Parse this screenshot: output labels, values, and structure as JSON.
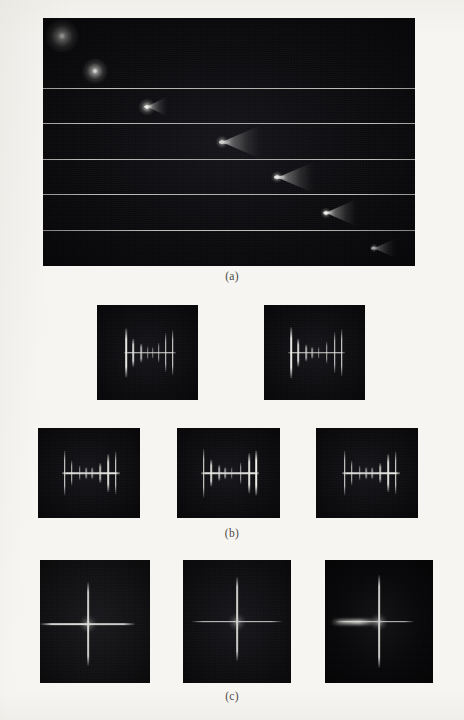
{
  "figure": {
    "background_color": "#f6f5f2",
    "panel_background_color": "#0a0a0c",
    "feature_color": "#fffff6",
    "separator_color": "#d8d7d2"
  },
  "captions": {
    "a": "(a)",
    "b": "(b)",
    "c": "(c)"
  },
  "panel_a": {
    "label": "(a)",
    "description": "Time sequence of a luminous projectile traversing the field of view, developing a conical bow shock",
    "frame_count": 7,
    "frames": [
      {
        "index": 1,
        "x_percent": 5,
        "core_size": 5,
        "halo_size": 34,
        "cone_length": 0,
        "cone_height": 0,
        "brightness": 0.8,
        "shape": "diffuse-glow"
      },
      {
        "index": 2,
        "x_percent": 14,
        "core_size": 4,
        "halo_size": 26,
        "cone_length": 0,
        "cone_height": 0,
        "brightness": 0.92,
        "shape": "point-with-halo"
      },
      {
        "index": 3,
        "x_percent": 28,
        "core_size": 4,
        "halo_size": 17,
        "cone_length": 22,
        "cone_height": 22,
        "brightness": 1.0,
        "shape": "small-cone"
      },
      {
        "index": 4,
        "x_percent": 48,
        "core_size": 4,
        "halo_size": 13,
        "cone_length": 42,
        "cone_height": 36,
        "brightness": 1.0,
        "shape": "cone"
      },
      {
        "index": 5,
        "x_percent": 63,
        "core_size": 4,
        "halo_size": 12,
        "cone_length": 40,
        "cone_height": 34,
        "brightness": 1.0,
        "shape": "cone"
      },
      {
        "index": 6,
        "x_percent": 76,
        "core_size": 4,
        "halo_size": 11,
        "cone_length": 34,
        "cone_height": 30,
        "brightness": 0.95,
        "shape": "cone"
      },
      {
        "index": 7,
        "x_percent": 89,
        "core_size": 3,
        "halo_size": 9,
        "cone_length": 24,
        "cone_height": 22,
        "brightness": 0.85,
        "shape": "small-cone"
      }
    ]
  },
  "panel_b": {
    "label": "(b)",
    "description": "Five interferogram frames showing a horizontal fringe bar crossed by vertical fringe ticks",
    "tile_count": 5,
    "tiles": [
      {
        "index": 1,
        "row": "top",
        "bar_start_percent": 27,
        "bar_end_percent": 78,
        "ticks": [
          {
            "x_percent": 29,
            "height_percent": 52,
            "intensity": 1.0
          },
          {
            "x_percent": 36,
            "height_percent": 30,
            "intensity": 0.9
          },
          {
            "x_percent": 44,
            "height_percent": 20,
            "intensity": 0.72
          },
          {
            "x_percent": 50,
            "height_percent": 14,
            "intensity": 0.62
          },
          {
            "x_percent": 55,
            "height_percent": 13,
            "intensity": 0.58
          },
          {
            "x_percent": 61,
            "height_percent": 22,
            "intensity": 0.75
          },
          {
            "x_percent": 68,
            "height_percent": 42,
            "intensity": 0.95
          },
          {
            "x_percent": 75,
            "height_percent": 48,
            "intensity": 1.0
          }
        ]
      },
      {
        "index": 2,
        "row": "top",
        "bar_start_percent": 24,
        "bar_end_percent": 80,
        "ticks": [
          {
            "x_percent": 27,
            "height_percent": 54,
            "intensity": 1.0
          },
          {
            "x_percent": 34,
            "height_percent": 30,
            "intensity": 0.9
          },
          {
            "x_percent": 42,
            "height_percent": 18,
            "intensity": 0.7
          },
          {
            "x_percent": 48,
            "height_percent": 13,
            "intensity": 0.6
          },
          {
            "x_percent": 54,
            "height_percent": 13,
            "intensity": 0.58
          },
          {
            "x_percent": 62,
            "height_percent": 24,
            "intensity": 0.78
          },
          {
            "x_percent": 70,
            "height_percent": 44,
            "intensity": 0.96
          },
          {
            "x_percent": 77,
            "height_percent": 50,
            "intensity": 1.0
          }
        ]
      },
      {
        "index": 3,
        "row": "bottom",
        "bar_start_percent": 24,
        "bar_end_percent": 80,
        "ticks": [
          {
            "x_percent": 26,
            "height_percent": 50,
            "intensity": 1.0
          },
          {
            "x_percent": 33,
            "height_percent": 28,
            "intensity": 0.88
          },
          {
            "x_percent": 41,
            "height_percent": 17,
            "intensity": 0.68
          },
          {
            "x_percent": 47,
            "height_percent": 13,
            "intensity": 0.58
          },
          {
            "x_percent": 53,
            "height_percent": 13,
            "intensity": 0.56
          },
          {
            "x_percent": 61,
            "height_percent": 22,
            "intensity": 0.76
          },
          {
            "x_percent": 69,
            "height_percent": 42,
            "intensity": 0.94
          },
          {
            "x_percent": 76,
            "height_percent": 48,
            "intensity": 1.0
          }
        ]
      },
      {
        "index": 4,
        "row": "bottom",
        "bar_start_percent": 23,
        "bar_end_percent": 80,
        "ticks": [
          {
            "x_percent": 26,
            "height_percent": 54,
            "intensity": 1.0
          },
          {
            "x_percent": 33,
            "height_percent": 30,
            "intensity": 0.9
          },
          {
            "x_percent": 41,
            "height_percent": 18,
            "intensity": 0.7
          },
          {
            "x_percent": 47,
            "height_percent": 13,
            "intensity": 0.6
          },
          {
            "x_percent": 53,
            "height_percent": 13,
            "intensity": 0.58
          },
          {
            "x_percent": 62,
            "height_percent": 24,
            "intensity": 0.78
          },
          {
            "x_percent": 70,
            "height_percent": 44,
            "intensity": 0.96
          },
          {
            "x_percent": 77,
            "height_percent": 50,
            "intensity": 1.0
          }
        ]
      },
      {
        "index": 5,
        "row": "bottom",
        "bar_start_percent": 25,
        "bar_end_percent": 82,
        "ticks": [
          {
            "x_percent": 28,
            "height_percent": 50,
            "intensity": 1.0
          },
          {
            "x_percent": 35,
            "height_percent": 28,
            "intensity": 0.88
          },
          {
            "x_percent": 43,
            "height_percent": 17,
            "intensity": 0.68
          },
          {
            "x_percent": 49,
            "height_percent": 13,
            "intensity": 0.58
          },
          {
            "x_percent": 55,
            "height_percent": 13,
            "intensity": 0.56
          },
          {
            "x_percent": 63,
            "height_percent": 22,
            "intensity": 0.76
          },
          {
            "x_percent": 71,
            "height_percent": 42,
            "intensity": 0.94
          },
          {
            "x_percent": 78,
            "height_percent": 48,
            "intensity": 1.0
          }
        ]
      }
    ]
  },
  "panel_c": {
    "label": "(c)",
    "description": "Three frames showing a bright orthogonal cross (diffraction spike pattern)",
    "tile_count": 3,
    "tiles": [
      {
        "index": 1,
        "center_x_percent": 44,
        "center_y_percent": 52,
        "v_top_percent": 18,
        "v_bottom_percent": 86,
        "h_left_percent": 0,
        "h_right_percent": 86,
        "horizontal_flare": false,
        "background_level": "#101012"
      },
      {
        "index": 2,
        "center_x_percent": 50,
        "center_y_percent": 50,
        "v_top_percent": 14,
        "v_bottom_percent": 82,
        "h_left_percent": 8,
        "h_right_percent": 92,
        "horizontal_flare": false,
        "background_level": "#0e0e11"
      },
      {
        "index": 3,
        "center_x_percent": 50,
        "center_y_percent": 50,
        "v_top_percent": 12,
        "v_bottom_percent": 88,
        "h_left_percent": 10,
        "h_right_percent": 82,
        "horizontal_flare": true,
        "background_level": "#08080a"
      }
    ]
  },
  "layout": {
    "panel_a_rect": {
      "x": 43,
      "y": 18,
      "w": 372,
      "h": 248
    },
    "panel_b_top_rects": [
      {
        "x": 97,
        "y": 305,
        "w": 101,
        "h": 95
      },
      {
        "x": 264,
        "y": 305,
        "w": 101,
        "h": 95
      }
    ],
    "panel_b_bottom_rects": [
      {
        "x": 38,
        "y": 428,
        "w": 102,
        "h": 90
      },
      {
        "x": 177,
        "y": 428,
        "w": 103,
        "h": 90
      },
      {
        "x": 316,
        "y": 428,
        "w": 102,
        "h": 90
      }
    ],
    "panel_c_rects": [
      {
        "x": 40,
        "y": 560,
        "w": 110,
        "h": 123
      },
      {
        "x": 183,
        "y": 560,
        "w": 108,
        "h": 123
      },
      {
        "x": 325,
        "y": 560,
        "w": 108,
        "h": 123
      }
    ],
    "caption_a_y": 270,
    "caption_b_y": 527,
    "caption_c_y": 690
  }
}
